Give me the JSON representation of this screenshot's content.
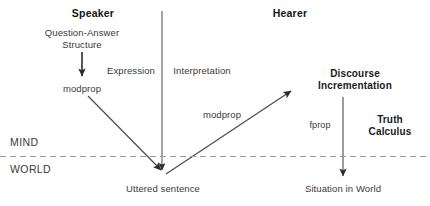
{
  "diagram": {
    "type": "flow-diagram",
    "canvas": {
      "width": 430,
      "height": 206
    },
    "colors": {
      "background": "#ffffff",
      "line": "#4a4a4a",
      "text": "#3a3a3a",
      "bold_text": "#141414",
      "divider": "#9a9a9a"
    },
    "roles": {
      "speaker": "Speaker",
      "hearer": "Hearer"
    },
    "nodes": {
      "question_answer_structure": "Question-Answer\nStructure",
      "question_answer_line1": "Question-Answer",
      "question_answer_line2": "Structure",
      "modprop_left": "modprop",
      "modprop_right": "modprop",
      "discourse_incrementation_line1": "Discourse",
      "discourse_incrementation_line2": "Incrementation",
      "truth_calculus_line1": "Truth",
      "truth_calculus_line2": "Calculus",
      "uttered_sentence": "Uttered sentence",
      "situation_in_world": "Situation in World"
    },
    "edge_labels": {
      "expression": "Expression",
      "interpretation": "Interpretation",
      "fprop": "fprop"
    },
    "zones": {
      "mind": "MIND",
      "world": "WORLD"
    }
  }
}
